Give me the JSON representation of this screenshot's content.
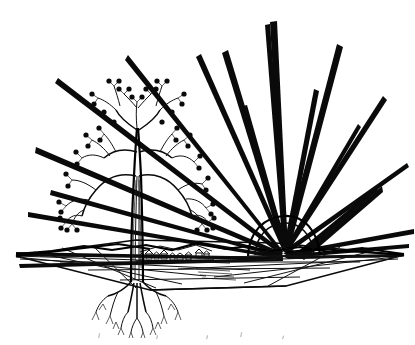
{
  "artwork": {
    "title": "Tree of Life with Rising Sun",
    "medium": "black ink line drawing",
    "canvas": {
      "width": 415,
      "height": 345
    },
    "background_color": "#ffffff",
    "ink_color": "#0a0a0a",
    "alt_text": "Black and white line-art illustration: a bare fractal tree bearing round fruit dots stands on a flat perspective plain with exposed branching roots; behind it a sun rises on the horizon emitting long sharp triangular rays across the sky; a tiny village sits in the middle distance."
  },
  "elements": {
    "tree": {
      "label": "Fractal tree",
      "trunk_label": "Tree trunk",
      "crown_label": "Tree crown",
      "roots_label": "Root system",
      "fruit_label": "Fruit dot",
      "fruit_count": 46,
      "branch_levels": 5,
      "trunk_x": 137,
      "trunk_base_y": 282,
      "crown_top_y": 98
    },
    "sun": {
      "label": "Rising sun",
      "dome_label": "Sun dome",
      "center_x": 283,
      "center_y": 251,
      "radius": 36,
      "ray_count": 22
    },
    "ground": {
      "label": "Ground plane",
      "horizon_label": "Horizon line",
      "horizon_y": 251,
      "left_vanish_x": 14,
      "right_vanish_x": 404
    },
    "village": {
      "label": "Village",
      "house_count": 9,
      "x": 148,
      "y": 256
    },
    "caption": {
      "label": "Cropped caption marks",
      "visible_text": ""
    }
  },
  "rays": {
    "label": "Sun rays",
    "description": "Long slender triangular spikes radiating from the sun across the sky and along the horizon",
    "angles_degrees": [
      182,
      176,
      168,
      160,
      150,
      141,
      132,
      124,
      116,
      108,
      100,
      92,
      84,
      76,
      68,
      60,
      52,
      44,
      36,
      26,
      14,
      4
    ]
  },
  "palette": {
    "ink": "#0a0a0a",
    "paper": "#ffffff",
    "hairline": "#1a1a1a",
    "caption_gray": "#8a8a8a"
  }
}
